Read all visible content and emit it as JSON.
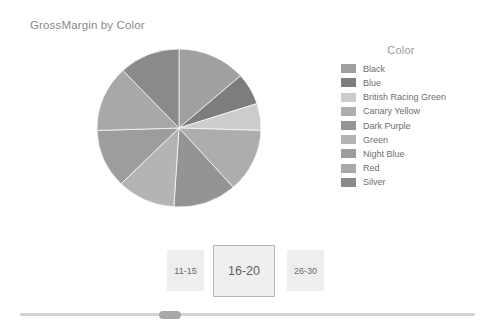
{
  "chart": {
    "title": "GrossMargin by Color"
  },
  "legend": {
    "title": "Color",
    "items": [
      {
        "label": "Black",
        "color": "#a0a0a0"
      },
      {
        "label": "Blue",
        "color": "#7d7d7d"
      },
      {
        "label": "British Racing Green",
        "color": "#cccccc"
      },
      {
        "label": "Canary Yellow",
        "color": "#adadad"
      },
      {
        "label": "Dark Purple",
        "color": "#949494"
      },
      {
        "label": "Green",
        "color": "#b4b4b4"
      },
      {
        "label": "Night Blue",
        "color": "#9d9d9d"
      },
      {
        "label": "Red",
        "color": "#a8a8a8"
      },
      {
        "label": "Silver",
        "color": "#8a8a8a"
      }
    ]
  },
  "slicer": {
    "tiles": [
      {
        "label": "11-15",
        "selected": false
      },
      {
        "label": "16-20",
        "selected": true
      },
      {
        "label": "26-30",
        "selected": false
      }
    ]
  },
  "scrollbar": {
    "orientation": "horizontal",
    "thumb_position_percent": 32
  },
  "chart_data": {
    "type": "pie",
    "title": "GrossMargin by Color",
    "legend_title": "Color",
    "legend_position": "right",
    "value_label": "GrossMargin",
    "category_label": "Color",
    "categories": [
      "Black",
      "Blue",
      "British Racing Green",
      "Canary Yellow",
      "Dark Purple",
      "Green",
      "Night Blue",
      "Red",
      "Silver"
    ],
    "values": [
      13.5,
      6.5,
      5.5,
      13.0,
      12.5,
      11.5,
      12.0,
      13.5,
      12.0
    ],
    "units": "percent",
    "colors": [
      "#a0a0a0",
      "#7d7d7d",
      "#cccccc",
      "#adadad",
      "#949494",
      "#b4b4b4",
      "#9d9d9d",
      "#a8a8a8",
      "#8a8a8a"
    ],
    "start_angle_deg": 0,
    "direction": "clockwise",
    "data_labels": false,
    "grid": false
  }
}
